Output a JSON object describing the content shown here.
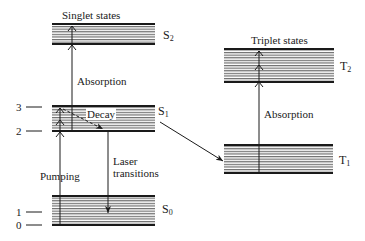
{
  "diagram": {
    "type": "energy-level-diagram",
    "groups": {
      "singlet_title": "Singlet states",
      "triplet_title": "Triplet states"
    },
    "states": [
      {
        "id": "S2",
        "letter": "S",
        "sub": "2"
      },
      {
        "id": "S1",
        "letter": "S",
        "sub": "1"
      },
      {
        "id": "S0",
        "letter": "S",
        "sub": "0"
      },
      {
        "id": "T2",
        "letter": "T",
        "sub": "2"
      },
      {
        "id": "T1",
        "letter": "T",
        "sub": "1"
      }
    ],
    "level_numbers": [
      "3",
      "2",
      "1",
      "0"
    ],
    "transitions": {
      "singlet_absorption": "Absorption",
      "decay": "Decay",
      "pumping": "Pumping",
      "laser_line1": "Laser",
      "laser_line2": "transitions",
      "triplet_absorption": "Absorption"
    },
    "colors": {
      "line": "#1a1a1a",
      "band_fill": "#9a9a9a"
    }
  }
}
